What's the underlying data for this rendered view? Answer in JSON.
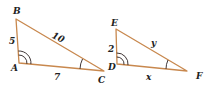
{
  "diagram": {
    "type": "similar-triangles",
    "colors": {
      "edge": "#c8884e",
      "mark": "#2a2020",
      "text": "#222222"
    },
    "triangle_1": {
      "vertices": {
        "B": {
          "label": "B",
          "x": 16,
          "y": 19
        },
        "A": {
          "label": "A",
          "x": 19,
          "y": 63
        },
        "C": {
          "label": "C",
          "x": 104,
          "y": 71
        }
      },
      "sides": {
        "AB": "5",
        "BC": "10",
        "AC": "7"
      },
      "angle_marks": {
        "A": "double-arc",
        "C": "single-arc"
      }
    },
    "triangle_2": {
      "vertices": {
        "E": {
          "label": "E",
          "x": 116,
          "y": 29
        },
        "D": {
          "label": "D",
          "x": 117,
          "y": 64
        },
        "F": {
          "label": "F",
          "x": 187,
          "y": 71
        }
      },
      "sides": {
        "DE": "2",
        "EF": "y",
        "DF": "x"
      },
      "angle_marks": {
        "D": "double-arc",
        "F": "single-arc"
      }
    }
  }
}
